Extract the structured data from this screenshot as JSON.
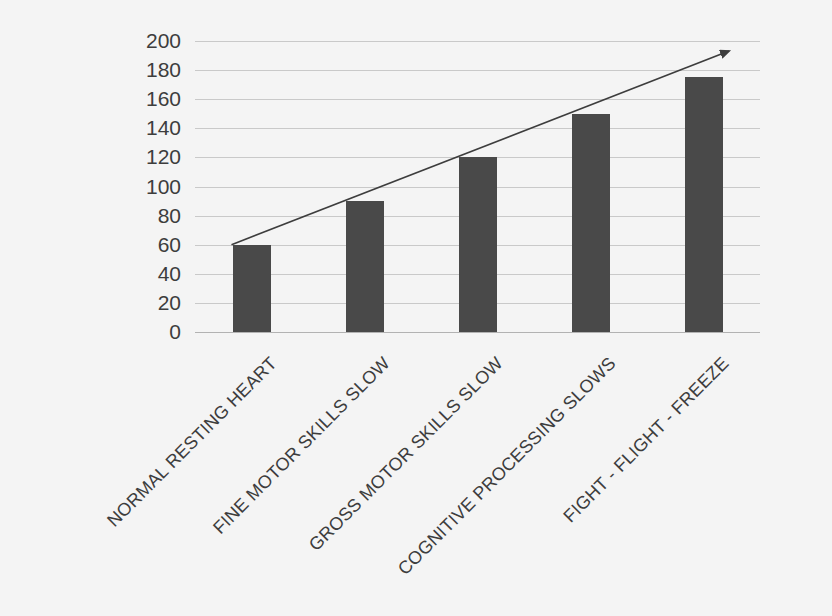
{
  "chart_data": {
    "type": "bar",
    "title": "",
    "subtitle": "",
    "xlabel": "",
    "ylabel": "",
    "categories": [
      "NORMAL RESTING HEART",
      "FINE MOTOR SKILLS SLOW",
      "GROSS MOTOR SKILLS SLOW",
      "COGNITIVE PROCESSING SLOWS",
      "FIGHT - FLIGHT - FREEZE"
    ],
    "values": [
      60,
      90,
      120,
      150,
      175
    ],
    "ylim": [
      0,
      200
    ],
    "ytick_step": 20,
    "yticks": [
      200,
      180,
      160,
      140,
      120,
      100,
      80,
      60,
      40,
      20,
      0
    ],
    "grid": true,
    "legend": false,
    "legend_position": "none",
    "bar_color": "#494949",
    "grid_color": "#c9c9c9",
    "background_color": "#f4f4f4",
    "annotations": [
      {
        "name": "rising-trend-arrow",
        "type": "arrow",
        "from_category": "NORMAL RESTING HEART",
        "from_value": 60,
        "to_value": 200,
        "color": "#3d3d3d",
        "description": "Upward trend arrow from first bar top to upper right"
      }
    ]
  }
}
